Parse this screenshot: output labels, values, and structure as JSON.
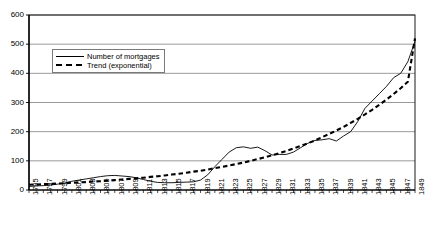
{
  "chart_data": {
    "type": "line",
    "title": "",
    "xlabel": "",
    "ylabel": "",
    "ylim": [
      0,
      600
    ],
    "ytick_step": 100,
    "yticks": [
      0,
      100,
      200,
      300,
      400,
      500,
      600
    ],
    "xlim": [
      1795,
      1849
    ],
    "xtick_step": 2,
    "grid": "horizontal",
    "legend_position": "inside-upper-left",
    "categories": [
      1795,
      1796,
      1797,
      1798,
      1799,
      1800,
      1801,
      1802,
      1803,
      1804,
      1805,
      1806,
      1807,
      1808,
      1809,
      1810,
      1811,
      1812,
      1813,
      1814,
      1815,
      1816,
      1817,
      1818,
      1819,
      1820,
      1821,
      1822,
      1823,
      1824,
      1825,
      1826,
      1827,
      1828,
      1829,
      1830,
      1831,
      1832,
      1833,
      1834,
      1835,
      1836,
      1837,
      1838,
      1839,
      1840,
      1841,
      1842,
      1843,
      1844,
      1845,
      1846,
      1847,
      1848,
      1849
    ],
    "xtick_labels": [
      "1795",
      "1797",
      "1799",
      "1801",
      "1803",
      "1805",
      "1807",
      "1809",
      "1811",
      "1813",
      "1815",
      "1817",
      "1819",
      "1821",
      "1823",
      "1825",
      "1827",
      "1829",
      "1831",
      "1833",
      "1835",
      "1837",
      "1839",
      "1841",
      "1843",
      "1845",
      "1847",
      "1849"
    ],
    "series": [
      {
        "name": "Number of mortgages",
        "style": "solid",
        "color": "#000000",
        "values": [
          12,
          14,
          15,
          17,
          20,
          24,
          30,
          34,
          38,
          42,
          46,
          49,
          50,
          48,
          46,
          42,
          36,
          30,
          26,
          25,
          25,
          26,
          27,
          28,
          34,
          52,
          80,
          105,
          130,
          145,
          148,
          143,
          147,
          135,
          120,
          122,
          122,
          130,
          145,
          160,
          170,
          172,
          176,
          168,
          185,
          200,
          235,
          280,
          305,
          330,
          355,
          385,
          400,
          440,
          510
        ]
      },
      {
        "name": "Trend (exponential)",
        "style": "dashed",
        "color": "#000000",
        "values": [
          18,
          19,
          20,
          21,
          22,
          23,
          25,
          26,
          27,
          29,
          30,
          32,
          34,
          36,
          38,
          40,
          42,
          45,
          47,
          50,
          53,
          56,
          59,
          63,
          66,
          70,
          75,
          79,
          84,
          89,
          94,
          100,
          106,
          112,
          119,
          126,
          134,
          142,
          151,
          160,
          170,
          181,
          192,
          204,
          216,
          230,
          244,
          259,
          275,
          292,
          310,
          329,
          349,
          371,
          520
        ]
      }
    ]
  },
  "legend": {
    "items": [
      {
        "label": "Number of mortgages",
        "style": "solid"
      },
      {
        "label": "Trend (exponential)",
        "style": "dashed"
      }
    ]
  },
  "axes": {
    "y_tick_labels": [
      "600",
      "500",
      "400",
      "300",
      "200",
      "100",
      "0"
    ]
  }
}
